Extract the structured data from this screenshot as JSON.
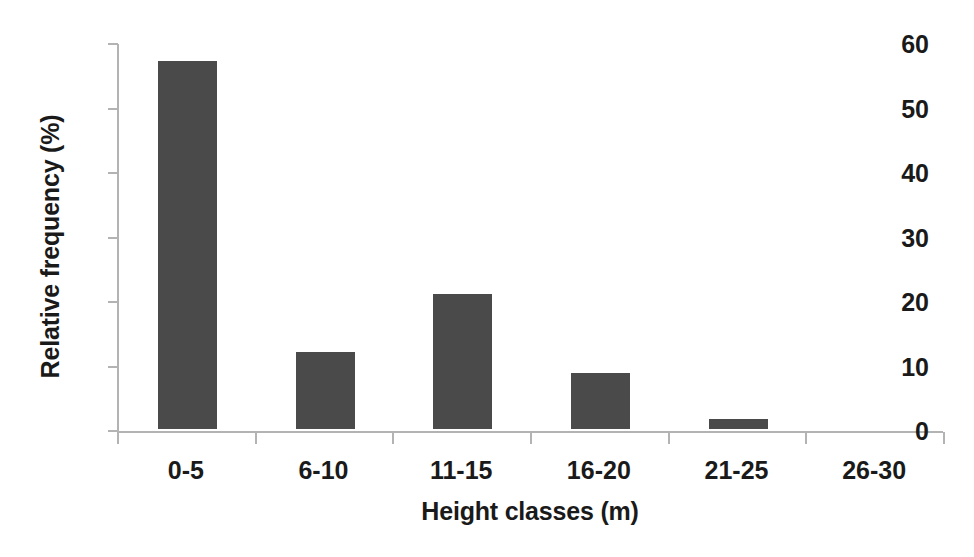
{
  "chart_data": {
    "type": "bar",
    "title": "",
    "xlabel": "Height classes (m)",
    "ylabel": "Relative frequency (%)",
    "categories": [
      "0-5",
      "6-10",
      "11-15",
      "16-20",
      "21-25",
      "26-30"
    ],
    "values": [
      57,
      12,
      21,
      8.7,
      1.5,
      0
    ],
    "ylim": [
      0,
      60
    ],
    "ytick_labels": [
      "60",
      "50",
      "40",
      "30",
      "20",
      "10",
      "0"
    ],
    "ytick_values": [
      60,
      50,
      40,
      30,
      20,
      10,
      0
    ],
    "ytick_step": 10,
    "grid": false,
    "legend": null,
    "bar_color": "#4a4a4a",
    "axis_color": "#b3b3b3",
    "text_color": "#1a1a1a",
    "background_color": "#ffffff"
  }
}
